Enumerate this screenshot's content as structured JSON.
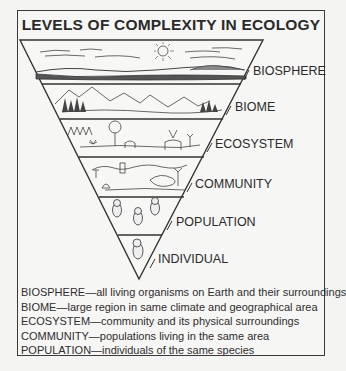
{
  "title": "LEVELS OF COMPLEXITY IN ECOLOGY",
  "levels": [
    {
      "name": "BIOSPHERE",
      "illustration": "sky with sun, clouds and distant landscape"
    },
    {
      "name": "BIOME",
      "illustration": "mountains with forest"
    },
    {
      "name": "ECOSYSTEM",
      "illustration": "trees, grassland and deer"
    },
    {
      "name": "COMMUNITY",
      "illustration": "various organisms in habitat"
    },
    {
      "name": "POPULATION",
      "illustration": "three owls"
    },
    {
      "name": "INDIVIDUAL",
      "illustration": "one owl"
    }
  ],
  "definitions": [
    {
      "term": "BIOSPHERE",
      "text": "BIOSPHERE—all living organisms on Earth and their surroundings"
    },
    {
      "term": "BIOME",
      "text": "BIOME—large region in same climate and geographical area"
    },
    {
      "term": "ECOSYSTEM",
      "text": "ECOSYSTEM—community and its physical surroundings"
    },
    {
      "term": "COMMUNITY",
      "text": "COMMUNITY—populations living in the same area"
    },
    {
      "term": "POPULATION",
      "text": "POPULATION—individuals of the same species"
    }
  ]
}
